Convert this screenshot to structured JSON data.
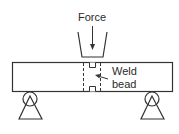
{
  "diagram": {
    "type": "three-point bend test",
    "labels": {
      "force": "Force",
      "weld_line1": "Weld",
      "weld_line2": "bead"
    },
    "elements": [
      "plunger",
      "specimen-beam",
      "weld-bead",
      "left-roller-support",
      "right-roller-support"
    ],
    "colors": {
      "stroke": "#333333",
      "background": "#ffffff"
    }
  }
}
